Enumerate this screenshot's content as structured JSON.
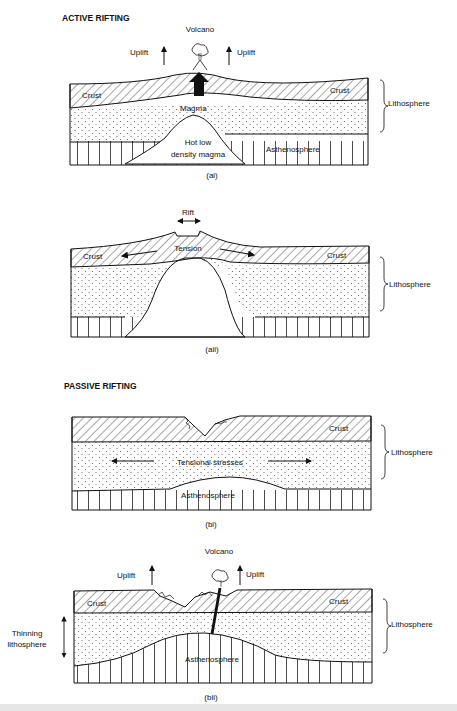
{
  "sections": {
    "active": {
      "heading": "ACTIVE RIFTING",
      "ai": {
        "caption": "(ai)",
        "volcano": "Volcano",
        "uplift_left": "Uplift",
        "uplift_right": "Uplift",
        "crust_left": "Crust",
        "crust_right": "Crust",
        "magma": "Magma",
        "hot_magma_line1": "Hot low",
        "hot_magma_line2": "density magma",
        "asthenosphere": "Asthenosphere",
        "lithosphere": "Lithosphere"
      },
      "aii": {
        "caption": "(aii)",
        "rift": "Rift",
        "tension": "Tension",
        "crust_left": "Crust",
        "crust_right": "Crust",
        "lithosphere": "Lithosphere"
      }
    },
    "passive": {
      "heading": "PASSIVE RIFTING",
      "bi": {
        "caption": "(bi)",
        "crust": "Crust",
        "tensional": "Tensional stresses",
        "asthenosphere": "Asthenosphere",
        "lithosphere": "Lithosphere"
      },
      "bii": {
        "caption": "(bii)",
        "volcano": "Volcano",
        "uplift_left": "Uplift",
        "uplift_right": "Uplift",
        "crust_left": "Crust",
        "crust_right": "Crust",
        "thinning_line1": "Thinning",
        "thinning_line2": "lithosphere",
        "asthenosphere": "Asthenosphere",
        "lithosphere": "Lithosphere"
      }
    }
  }
}
